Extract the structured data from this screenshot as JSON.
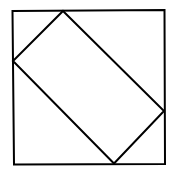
{
  "diagram": {
    "shapes": [
      {
        "name": "outer-square",
        "type": "square"
      },
      {
        "name": "inscribed-rectangle",
        "type": "rectangle",
        "vertices_touch": [
          "top",
          "right",
          "bottom",
          "left"
        ]
      }
    ],
    "stroke_color": "#000000",
    "fill_color": "#ffffff"
  }
}
